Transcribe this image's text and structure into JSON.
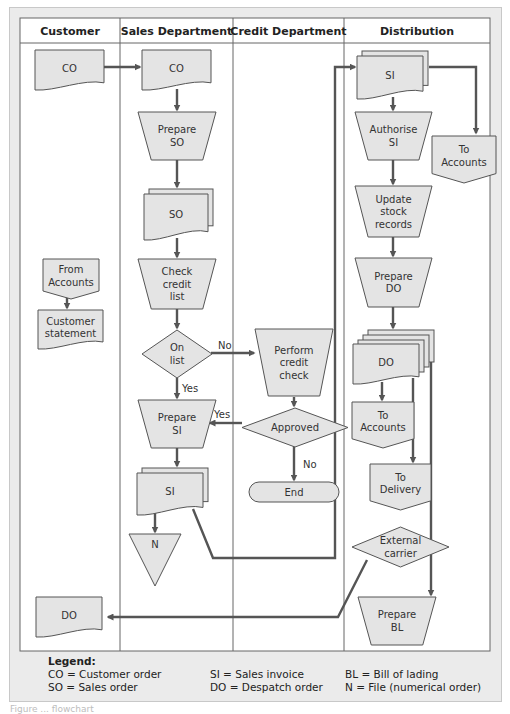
{
  "lanes": [
    {
      "id": "customer",
      "label": "Customer"
    },
    {
      "id": "sales",
      "label": "Sales Department"
    },
    {
      "id": "credit",
      "label": "Credit Department"
    },
    {
      "id": "distribution",
      "label": "Distribution"
    }
  ],
  "colors": {
    "shape_fill": "#e4e4e4",
    "stroke": "#555555",
    "panel": "#ebebeb",
    "grid": "#777777"
  },
  "nodes": [
    {
      "id": "cust-co",
      "type": "document",
      "lane": "customer",
      "lines": [
        "CO"
      ]
    },
    {
      "id": "sales-co",
      "type": "document",
      "lane": "sales",
      "lines": [
        "CO"
      ]
    },
    {
      "id": "prep-so",
      "type": "manual-op",
      "lane": "sales",
      "lines": [
        "Prepare",
        "SO"
      ]
    },
    {
      "id": "so-docs",
      "type": "multi-document",
      "lane": "sales",
      "lines": [
        "SO"
      ]
    },
    {
      "id": "check-credit",
      "type": "manual-op",
      "lane": "sales",
      "lines": [
        "Check",
        "credit",
        "list"
      ]
    },
    {
      "id": "on-list",
      "type": "decision",
      "lane": "sales",
      "lines": [
        "On",
        "list"
      ]
    },
    {
      "id": "prep-si",
      "type": "manual-op",
      "lane": "sales",
      "lines": [
        "Prepare",
        "SI"
      ]
    },
    {
      "id": "si-docs",
      "type": "multi-document",
      "lane": "sales",
      "lines": [
        "SI"
      ]
    },
    {
      "id": "file-n",
      "type": "file",
      "lane": "sales",
      "lines": [
        "N"
      ]
    },
    {
      "id": "from-accounts",
      "type": "offpage",
      "lane": "customer",
      "lines": [
        "From",
        "Accounts"
      ]
    },
    {
      "id": "cust-statement",
      "type": "document",
      "lane": "customer",
      "lines": [
        "Customer",
        "statement"
      ]
    },
    {
      "id": "cust-do",
      "type": "document",
      "lane": "customer",
      "lines": [
        "DO"
      ]
    },
    {
      "id": "perform-credit",
      "type": "manual-op",
      "lane": "credit",
      "lines": [
        "Perform",
        "credit",
        "check"
      ]
    },
    {
      "id": "approved",
      "type": "decision",
      "lane": "credit",
      "lines": [
        "Approved"
      ]
    },
    {
      "id": "end",
      "type": "terminator",
      "lane": "credit",
      "lines": [
        "End"
      ]
    },
    {
      "id": "dist-si",
      "type": "multi-document",
      "lane": "distribution",
      "lines": [
        "SI"
      ]
    },
    {
      "id": "authorise-si",
      "type": "manual-op",
      "lane": "distribution",
      "lines": [
        "Authorise",
        "SI"
      ]
    },
    {
      "id": "to-accounts-1",
      "type": "offpage",
      "lane": "distribution",
      "lines": [
        "To",
        "Accounts"
      ]
    },
    {
      "id": "update-stock",
      "type": "manual-op",
      "lane": "distribution",
      "lines": [
        "Update",
        "stock",
        "records"
      ]
    },
    {
      "id": "prep-do",
      "type": "manual-op",
      "lane": "distribution",
      "lines": [
        "Prepare",
        "DO"
      ]
    },
    {
      "id": "do-docs",
      "type": "multi-document",
      "lane": "distribution",
      "lines": [
        "DO"
      ]
    },
    {
      "id": "to-accounts-2",
      "type": "offpage",
      "lane": "distribution",
      "lines": [
        "To",
        "Accounts"
      ]
    },
    {
      "id": "to-delivery",
      "type": "offpage",
      "lane": "distribution",
      "lines": [
        "To",
        "Delivery"
      ]
    },
    {
      "id": "ext-carrier",
      "type": "decision",
      "lane": "distribution",
      "lines": [
        "External",
        "carrier"
      ]
    },
    {
      "id": "prep-bl",
      "type": "manual-op",
      "lane": "distribution",
      "lines": [
        "Prepare",
        "BL"
      ]
    }
  ],
  "edge_labels": {
    "no": "No",
    "yes": "Yes"
  },
  "legend": {
    "title": "Legend:",
    "rows": [
      [
        "CO = Customer order",
        "SI   = Sales invoice",
        "BL  =  Bill of lading"
      ],
      [
        "SO  = Sales order",
        "DO = Despatch order",
        "N    =  File (numerical order)"
      ]
    ]
  },
  "caption": "Figure ... flowchart"
}
